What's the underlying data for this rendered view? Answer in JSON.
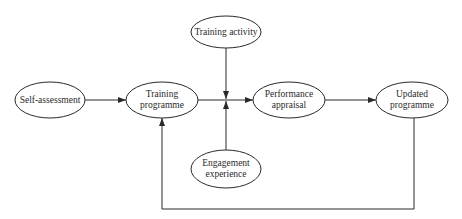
{
  "diagram": {
    "type": "flowchart",
    "stroke_color": "#2a2a2a",
    "nodes": [
      {
        "id": "self_assessment",
        "label": "Self-assessment",
        "cx": 50,
        "cy": 100,
        "rx": 35,
        "ry": 18
      },
      {
        "id": "training_programme",
        "label": "Training programme",
        "cx": 162,
        "cy": 100,
        "rx": 36,
        "ry": 18
      },
      {
        "id": "training_activity",
        "label": "Training activity",
        "cx": 226,
        "cy": 32,
        "rx": 35,
        "ry": 16
      },
      {
        "id": "engagement_experience",
        "label": "Engagement experience",
        "cx": 226,
        "cy": 169,
        "rx": 35,
        "ry": 19
      },
      {
        "id": "performance_appraisal",
        "label": "Performance appraisal",
        "cx": 289,
        "cy": 100,
        "rx": 36,
        "ry": 18
      },
      {
        "id": "updated_programme",
        "label": "Updated programme",
        "cx": 412,
        "cy": 100,
        "rx": 36,
        "ry": 18
      }
    ],
    "edges": [
      {
        "from": "self_assessment",
        "to": "training_programme"
      },
      {
        "from": "training_programme",
        "to": "performance_appraisal"
      },
      {
        "from": "training_activity",
        "to": "junction"
      },
      {
        "from": "engagement_experience",
        "to": "junction"
      },
      {
        "from": "performance_appraisal",
        "to": "updated_programme"
      },
      {
        "from": "updated_programme",
        "to": "training_programme",
        "kind": "feedback"
      }
    ]
  },
  "labels": {
    "self_assessment": "Self-assessment",
    "training_programme_1": "Training",
    "training_programme_2": "programme",
    "training_activity": "Training activity",
    "engagement_experience_1": "Engagement",
    "engagement_experience_2": "experience",
    "performance_appraisal_1": "Performance",
    "performance_appraisal_2": "appraisal",
    "updated_programme_1": "Updated",
    "updated_programme_2": "programme"
  }
}
